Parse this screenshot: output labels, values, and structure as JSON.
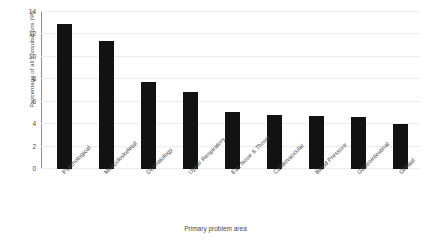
{
  "chart_data": {
    "type": "bar",
    "title": "",
    "xlabel": "Primary problem area",
    "ylabel": "Percentage of all consultations (%)",
    "categories": [
      "Psychological",
      "Musculoskeletal",
      "Dermatology",
      "Upper Respiratory",
      "Ear, Nose & Throat",
      "Cardiovascular",
      "Blood Pressure",
      "Gastrointestinal",
      "Genital"
    ],
    "values": [
      12.9,
      11.4,
      7.8,
      6.9,
      5.1,
      4.8,
      4.7,
      4.6,
      4.0
    ],
    "ylim": [
      0,
      14
    ],
    "yticks": [
      0,
      2,
      4,
      6,
      8,
      10,
      12,
      14
    ],
    "ytick_labels": [
      "0",
      "2",
      "4",
      "6",
      "8",
      "10",
      "12",
      "14"
    ],
    "grid": true,
    "legend": false,
    "bar_color": "#121212",
    "grid_color": "#ededed",
    "axis_color": "#8c8c8c",
    "background_color": "#ffffff"
  }
}
